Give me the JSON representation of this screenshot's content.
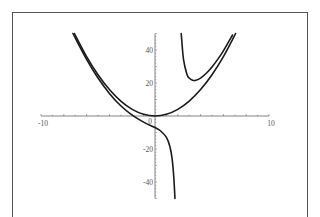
{
  "chart_data": {
    "type": "line",
    "title": "",
    "xlabel": "",
    "ylabel": "",
    "xlim": [
      -10,
      10
    ],
    "ylim": [
      -50,
      50
    ],
    "grid": false,
    "legend": null,
    "x_ticks": [
      {
        "value": -10,
        "label": "-10"
      },
      {
        "value": 0,
        "label": "0"
      },
      {
        "value": 10,
        "label": "10"
      }
    ],
    "y_ticks": [
      {
        "value": 40,
        "label": "40"
      },
      {
        "value": 20,
        "label": "20"
      },
      {
        "value": -20,
        "label": "-20"
      },
      {
        "value": -40,
        "label": "-40"
      }
    ],
    "series": [
      {
        "name": "parabola",
        "description": "y = x^2",
        "x": [
          -7.07,
          -6,
          -5,
          -4,
          -3,
          -2,
          -1,
          0,
          1,
          2,
          3,
          4,
          5,
          6,
          7.07
        ],
        "y": [
          50,
          36,
          25,
          16,
          9,
          4,
          1,
          0,
          1,
          4,
          9,
          16,
          25,
          36,
          50
        ]
      },
      {
        "name": "rational-left-branch",
        "description": "approx y = x^2 + 14/(x-2), x < 2",
        "x": [
          -7.2,
          -6,
          -5,
          -4,
          -3,
          -2,
          -1,
          0,
          0.5,
          1,
          1.3,
          1.5,
          1.65,
          1.75
        ],
        "y": [
          50,
          34.3,
          23,
          13.7,
          6.2,
          0.5,
          -3.7,
          -7,
          -9.1,
          -13,
          -18.3,
          -25.8,
          -37.3,
          -50
        ]
      },
      {
        "name": "rational-right-branch",
        "description": "approx y = x^2 + 14/(x-2), x > 2",
        "x": [
          2.3,
          2.5,
          2.8,
          3.0,
          3.3,
          3.6,
          4,
          4.5,
          5,
          5.5,
          6,
          6.8
        ],
        "y": [
          50,
          34.3,
          25.3,
          23,
          21.7,
          21.7,
          23,
          25.9,
          29.7,
          34.3,
          39.5,
          49.1
        ]
      }
    ]
  },
  "colors": {
    "curve": "#1a1a1a",
    "axis": "#666666",
    "frame": "#555555",
    "label": "#555555"
  }
}
